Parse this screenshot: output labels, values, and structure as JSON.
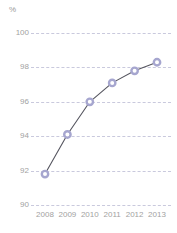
{
  "chart_data": {
    "type": "line",
    "title": "",
    "subtitle": "",
    "xlabel": "",
    "ylabel": "%",
    "unit_label": "%",
    "categories": [
      "2008",
      "2009",
      "2010",
      "2011",
      "2012",
      "2013"
    ],
    "values": [
      91.8,
      94.1,
      96.0,
      97.1,
      97.8,
      98.3
    ],
    "series": [
      {
        "name": "",
        "values": [
          91.8,
          94.1,
          96.0,
          97.1,
          97.8,
          98.3
        ]
      }
    ],
    "ylim": [
      90,
      100
    ],
    "yticks": [
      90,
      92,
      94,
      96,
      98,
      100
    ],
    "ytick_labels": [
      "90",
      "92",
      "94",
      "96",
      "98",
      "100"
    ],
    "xticks": [
      "2008",
      "2009",
      "2010",
      "2011",
      "2012",
      "2013"
    ],
    "grid": true,
    "grid_axis": "y",
    "grid_style": "dashed",
    "legend": false,
    "legend_position": "none",
    "annotations": [],
    "colors": {
      "line": "#55555f",
      "marker_ring": "#a6a6cf",
      "marker_fill": "#ffffff",
      "gridline": "#c9c9dd",
      "tick_text": "#a2a2a2",
      "unit_text": "#9a9a9a",
      "background": "#ffffff"
    }
  }
}
